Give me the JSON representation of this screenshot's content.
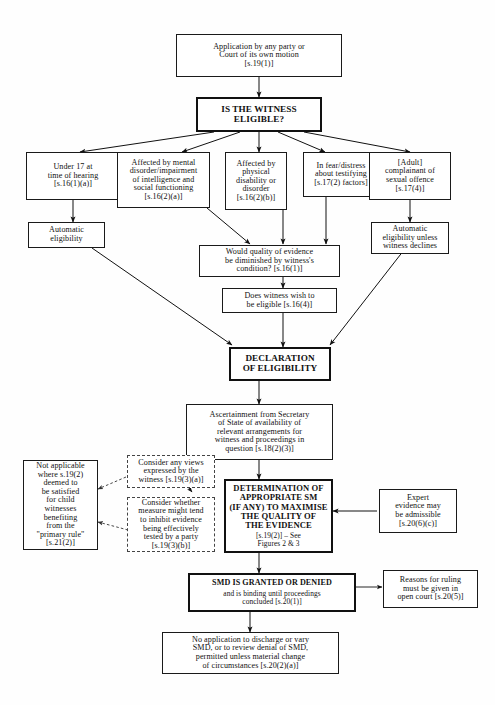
{
  "diagram": {
    "nodes": [
      {
        "id": "application",
        "text": "Application by any party or\nCourt of its own motion\n[s.19(1)]"
      },
      {
        "id": "is_witness_eligible",
        "text": "IS THE WITNESS\nELIGIBLE?"
      },
      {
        "id": "under17",
        "text": "Under 17 at\ntime of hearing\n[s.16(1)(a)]"
      },
      {
        "id": "mental_disorder",
        "text": "Affected by mental\ndisorder/impairment\nof intelligence and\nsocial functioning\n[s.16(2)(a)]"
      },
      {
        "id": "physical_disability",
        "text": "Affected by\nphysical\ndisability or\ndisorder\n[s.16(2)(b)]"
      },
      {
        "id": "fear_distress",
        "text": "In fear/distress\nabout testifying\n[s.17(2) factors]"
      },
      {
        "id": "adult_complainant",
        "text": "[Adult]\ncomplainant of\nsexual offence\n[s.17(4)]"
      },
      {
        "id": "automatic_eligibility",
        "text": "Automatic\neligibility"
      },
      {
        "id": "automatic_unless_declines",
        "text": "Automatic\neligibility unless\nwitness declines"
      },
      {
        "id": "quality_diminished",
        "text": "Would quality of evidence\nbe diminished by witness's\ncondition? [s.16(1)]"
      },
      {
        "id": "witness_wish",
        "text": "Does witness wish to\nbe eligible [s.16(4)]"
      },
      {
        "id": "declaration",
        "text": "DECLARATION\nOF ELIGIBILITY"
      },
      {
        "id": "ascertainment",
        "text": "Ascertainment from Secretary\nof State of availability of\nrelevant arrangements for\nwitness and proceedings in\nquestion [s.18(2)(3)]"
      },
      {
        "id": "not_applicable",
        "text": "Not applicable\nwhere s.19(2)\ndeemed to\nbe satisfied\nfor child\nwitnesses\nbenefiting\nfrom the\n\"primary rule\"\n[s.21(2)]"
      },
      {
        "id": "consider_views",
        "text": "Consider any views\nexpressed by the\nwitness [s.19(3)(a)]"
      },
      {
        "id": "consider_measure",
        "text": "Consider whether\nmeasure might tend\nto inhibit evidence\nbeing effectively\ntested by a party\n[s.19(3)(b)]"
      },
      {
        "id": "determination",
        "text": "DETERMINATION OF\nAPPROPRIATE SM\n(IF ANY) TO MAXIMISE\nTHE QUALITY OF\nTHE EVIDENCE",
        "subtext": "[s.19(2)] – See\nFigures 2 & 3"
      },
      {
        "id": "expert_evidence",
        "text": "Expert\nevidence may\nbe admissible\n[s.20(6)(c)]"
      },
      {
        "id": "smd_granted",
        "text": "SMD IS GRANTED OR DENIED",
        "subtext": "and is binding until proceedings\nconcluded [s.20(1)]"
      },
      {
        "id": "reasons_ruling",
        "text": "Reasons for ruling\nmust be given in\nopen court [s.20(5)]"
      },
      {
        "id": "no_application",
        "text": "No application to discharge or vary\nSMD, or to review denial of SMD,\npermitted unless material change\nof circumstances [s.20(2)(a)]"
      }
    ]
  }
}
